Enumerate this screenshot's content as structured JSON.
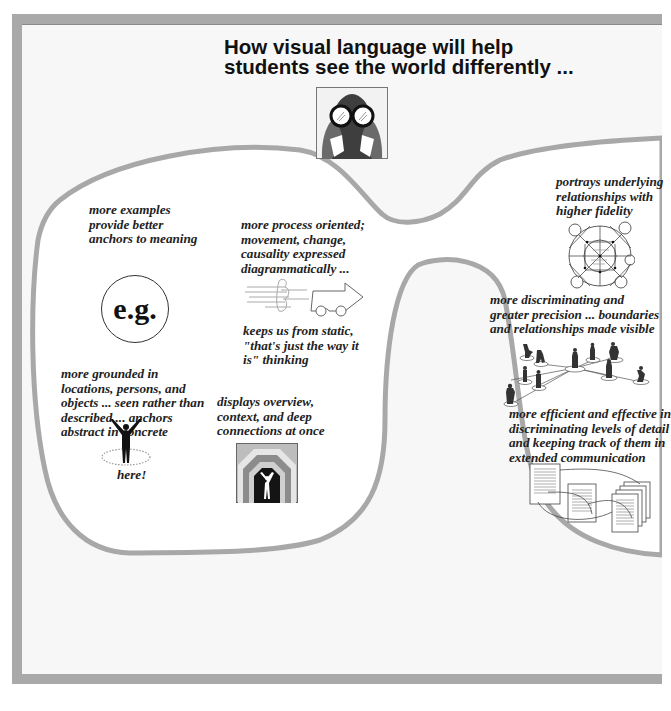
{
  "header": {
    "title_line1": "How visual language will help",
    "title_line2": "students see the world differently ..."
  },
  "icons": {
    "header_icon": "binoculars-person-icon",
    "examples_icon": "e-g-circle-icon",
    "process_icon": "moving-vehicle-icon",
    "grounded_icon": "standing-figure-icon",
    "overview_icon": "nested-frames-icon",
    "relationships_icon": "network-circle-icon",
    "precision_icon": "connected-people-icon",
    "efficiency_icon": "linked-documents-icon"
  },
  "left_lens": {
    "examples": {
      "lines": [
        "more examples",
        "provide better",
        "anchors to meaning"
      ],
      "badge": "e.g."
    },
    "process": {
      "lines": [
        "more process oriented;",
        "movement, change,",
        "causality expressed",
        "diagrammatically ..."
      ]
    },
    "static": {
      "lines": [
        "keeps us from static,",
        "\"that's just the way it",
        "is\" thinking"
      ]
    },
    "grounded": {
      "lines": [
        "more grounded in",
        "locations, persons, and",
        "objects ... seen rather than",
        "described ... anchors",
        "abstract in concrete"
      ],
      "caption": "here!"
    },
    "overview": {
      "lines": [
        "displays overview,",
        "context, and deep",
        "connections at once"
      ]
    }
  },
  "right_lens": {
    "relationships": {
      "lines": [
        "portrays underlying",
        "relationships with",
        "higher fidelity"
      ]
    },
    "precision": {
      "lines": [
        "more discriminating and",
        "greater precision ... boundaries",
        "and relationships made visible"
      ]
    },
    "efficiency": {
      "lines": [
        "more efficient and effective in",
        "discriminating levels of detail",
        "and keeping track of them in",
        "extended communication"
      ]
    }
  },
  "colors": {
    "frame": "#a9a9a9",
    "lens_outline": "#a8a8a8",
    "page_bg": "#f7f7f7",
    "lens_fill": "#ffffff",
    "text": "#222222"
  }
}
